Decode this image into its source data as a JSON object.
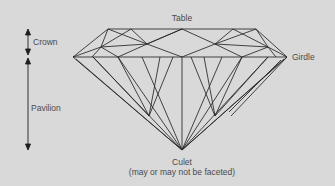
{
  "diagram": {
    "type": "diamond-anatomy",
    "background": "#d9d9d9",
    "line_color": "#2a2a2a",
    "labels": {
      "table": "Table",
      "girdle": "Girdle",
      "crown": "Crown",
      "pavilion": "Pavilion",
      "culet": "Culet",
      "culet_note": "(may or may not be faceted)"
    }
  }
}
